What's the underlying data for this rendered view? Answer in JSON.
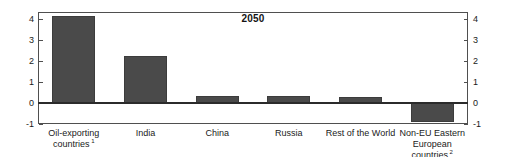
{
  "chart_data": {
    "type": "bar",
    "title": "2050",
    "xlabel": "",
    "ylabel": "",
    "ylim": [
      -1,
      4.35
    ],
    "yticks": [
      4,
      3,
      2,
      1,
      0,
      -1
    ],
    "ytick_labels": [
      "4",
      "3",
      "2",
      "1",
      "0",
      "-1"
    ],
    "right_axis": true,
    "right_ytick_labels": [
      "4",
      "3",
      "2",
      "1",
      "0",
      "-1"
    ],
    "grid": false,
    "legend": null,
    "zero_line": 0,
    "bar_color": "#4a4a4a",
    "categories": [
      "Oil-exporting countries",
      "India",
      "China",
      "Russia",
      "Rest of the World",
      "Non-EU Eastern European countries"
    ],
    "category_labels": [
      {
        "line1": "Oil-exporting",
        "line2": "countries",
        "footnote": "1"
      },
      {
        "line1": "India",
        "line2": "",
        "footnote": ""
      },
      {
        "line1": "China",
        "line2": "",
        "footnote": ""
      },
      {
        "line1": "Russia",
        "line2": "",
        "footnote": ""
      },
      {
        "line1": "Rest of the World",
        "line2": "",
        "footnote": ""
      },
      {
        "line1": "Non-EU Eastern",
        "line2": "European countries",
        "footnote": "2"
      }
    ],
    "values": [
      4.17,
      2.27,
      0.35,
      0.32,
      0.27,
      -0.9
    ]
  },
  "axis": {
    "left_ticks": [
      "4",
      "3",
      "2",
      "1",
      "0",
      "-1"
    ],
    "right_ticks": [
      "4",
      "3",
      "2",
      "1",
      "0",
      "-1"
    ]
  }
}
